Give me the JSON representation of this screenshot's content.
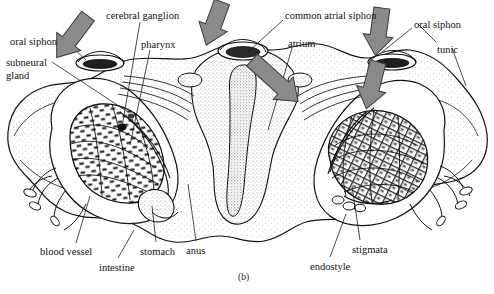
{
  "figure": {
    "caption": "(b)",
    "background_color": "#ffffff",
    "ink_color": "#111111",
    "arrow_color": "#8a8a8a",
    "arrow_outline_color": "#3a3a3a",
    "stipple_color": "#4a4a4a"
  },
  "labels": [
    {
      "id": "oral-siphon-left",
      "text": "oral siphon",
      "x": 10,
      "y": 36
    },
    {
      "id": "subneural-gland",
      "text": "subneural",
      "x": 6,
      "y": 57
    },
    {
      "id": "subneural-gland-2",
      "text": "gland",
      "x": 6,
      "y": 70
    },
    {
      "id": "cerebral-ganglion",
      "text": "cerebral ganglion",
      "x": 106,
      "y": 10
    },
    {
      "id": "pharynx",
      "text": "pharynx",
      "x": 141,
      "y": 39
    },
    {
      "id": "common-atrial-siphon",
      "text": "common atrial siphon",
      "x": 285,
      "y": 10
    },
    {
      "id": "atrium",
      "text": "atrium",
      "x": 288,
      "y": 38
    },
    {
      "id": "oral-siphon-right",
      "text": "oral siphon",
      "x": 414,
      "y": 19
    },
    {
      "id": "tunic",
      "text": "tunic",
      "x": 437,
      "y": 44
    },
    {
      "id": "blood-vessel",
      "text": "blood vessel",
      "x": 40,
      "y": 246
    },
    {
      "id": "intestine",
      "text": "intestine",
      "x": 99,
      "y": 262
    },
    {
      "id": "stomach",
      "text": "stomach",
      "x": 140,
      "y": 246
    },
    {
      "id": "anus",
      "text": "anus",
      "x": 186,
      "y": 245
    },
    {
      "id": "stigmata",
      "text": "stigmata",
      "x": 352,
      "y": 244
    },
    {
      "id": "endostyle",
      "text": "endostyle",
      "x": 310,
      "y": 261
    }
  ],
  "leader_lines": [
    {
      "id": "leader-oral-siphon-left",
      "from": [
        62,
        38
      ],
      "to": [
        86,
        60
      ]
    },
    {
      "id": "leader-subneural-gland",
      "from": [
        52,
        62
      ],
      "to": [
        128,
        112
      ]
    },
    {
      "id": "leader-cerebral-ganglion",
      "from": [
        140,
        22
      ],
      "to": [
        122,
        127
      ]
    },
    {
      "id": "leader-pharynx",
      "from": [
        150,
        50
      ],
      "to": [
        130,
        145
      ]
    },
    {
      "id": "leader-common-atrial-siphon",
      "from": [
        283,
        20
      ],
      "to": [
        248,
        52
      ]
    },
    {
      "id": "leader-atrium",
      "from": [
        292,
        48
      ],
      "to": [
        268,
        130
      ]
    },
    {
      "id": "leader-oral-siphon-right",
      "from": [
        412,
        28
      ],
      "to": [
        382,
        52
      ]
    },
    {
      "id": "leader-tunic-a",
      "from": [
        436,
        42
      ],
      "to": [
        418,
        24
      ]
    },
    {
      "id": "leader-tunic-b",
      "from": [
        452,
        48
      ],
      "to": [
        466,
        86
      ]
    },
    {
      "id": "leader-blood-vessel",
      "from": [
        76,
        243
      ],
      "to": [
        90,
        196
      ]
    },
    {
      "id": "leader-intestine",
      "from": [
        118,
        258
      ],
      "to": [
        134,
        230
      ]
    },
    {
      "id": "leader-stomach",
      "from": [
        156,
        242
      ],
      "to": [
        152,
        206
      ]
    },
    {
      "id": "leader-anus",
      "from": [
        196,
        241
      ],
      "to": [
        188,
        184
      ]
    },
    {
      "id": "leader-stigmata",
      "from": [
        360,
        240
      ],
      "to": [
        352,
        186
      ]
    },
    {
      "id": "leader-endostyle",
      "from": [
        330,
        257
      ],
      "to": [
        346,
        214
      ]
    }
  ],
  "arrows": [
    {
      "id": "arrow-inhalant-left",
      "direction": "down-right",
      "x": 88,
      "y": 16,
      "rotation": 37,
      "length": 52,
      "meaning": "water entering left oral siphon"
    },
    {
      "id": "arrow-inhalant-center",
      "direction": "down",
      "x": 222,
      "y": 2,
      "rotation": 20,
      "length": 46,
      "meaning": "water entering center oral siphon"
    },
    {
      "id": "arrow-exhalant-atrial",
      "direction": "up-right",
      "x": 252,
      "y": 60,
      "rotation": -48,
      "length": 62,
      "meaning": "water exiting common atrial siphon"
    },
    {
      "id": "arrow-inhalant-right",
      "direction": "down",
      "x": 382,
      "y": 8,
      "rotation": 8,
      "length": 48,
      "meaning": "water entering right oral siphon"
    },
    {
      "id": "arrow-flow-right-pharynx",
      "direction": "down",
      "x": 378,
      "y": 62,
      "rotation": 14,
      "length": 48,
      "meaning": "water flowing into right pharynx"
    }
  ]
}
